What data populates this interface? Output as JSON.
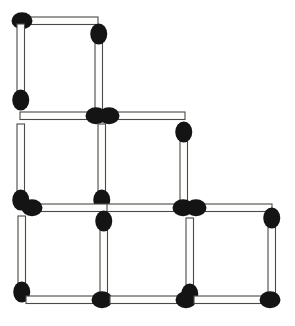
{
  "scene": {
    "title": "Matchstick puzzle figure",
    "description": "Line drawing of wooden matchsticks arranged to form a grid of squares",
    "width": 295,
    "height": 326,
    "background_color": "#ffffff",
    "stick_fill_color": "#fdfdfb",
    "stick_outline_color": "#4a4a4a",
    "head_color": "#141414",
    "match_count": 20,
    "stick_width": 7.5,
    "stick_length": 78,
    "head_rx": 8.5,
    "head_ry": 10.5
  },
  "matches": [
    {
      "id": "match-top-horizontal",
      "name": "top-row-horizontal-1",
      "orientation": "horizontal",
      "x": 20,
      "y": 17,
      "head_end": "start"
    },
    {
      "id": "match-upper-left-vertical",
      "name": "upper-left-vertical",
      "orientation": "vertical",
      "x": 17,
      "y": 24,
      "head_end": "end"
    },
    {
      "id": "match-upper-right-vertical",
      "name": "upper-right-vertical",
      "orientation": "vertical",
      "x": 95,
      "y": 32,
      "head_end": "start"
    },
    {
      "id": "match-row2-horizontal-left",
      "name": "row2-horizontal-left",
      "orientation": "horizontal",
      "x": 20,
      "y": 112,
      "head_end": "end"
    },
    {
      "id": "match-row2-horizontal-right",
      "name": "row2-horizontal-right",
      "orientation": "horizontal",
      "x": 107,
      "y": 112,
      "head_end": "start"
    },
    {
      "id": "match-row2-vertical-left",
      "name": "row2-vertical-left",
      "orientation": "vertical",
      "x": 17,
      "y": 124,
      "head_end": "end"
    },
    {
      "id": "match-row2-vertical-middle",
      "name": "row2-vertical-middle",
      "orientation": "vertical",
      "x": 98,
      "y": 124,
      "head_end": "end"
    },
    {
      "id": "match-row2-vertical-right",
      "name": "row2-vertical-right",
      "orientation": "vertical",
      "x": 180,
      "y": 130,
      "head_end": "start"
    },
    {
      "id": "match-row3-horizontal-left",
      "name": "row3-horizontal-left",
      "orientation": "horizontal",
      "x": 30,
      "y": 204,
      "head_end": "start"
    },
    {
      "id": "match-row3-horizontal-middle",
      "name": "row3-horizontal-middle",
      "orientation": "horizontal",
      "x": 107,
      "y": 204,
      "head_end": "end"
    },
    {
      "id": "match-row3-horizontal-right",
      "name": "row3-horizontal-right",
      "orientation": "horizontal",
      "x": 194,
      "y": 204,
      "head_end": "start"
    },
    {
      "id": "match-row4-vertical-left",
      "name": "row4-vertical-left",
      "orientation": "vertical",
      "x": 18,
      "y": 216,
      "head_end": "end"
    },
    {
      "id": "match-row4-vertical-middle",
      "name": "row4-vertical-middle",
      "orientation": "vertical",
      "x": 100,
      "y": 219,
      "head_end": "start"
    },
    {
      "id": "match-row4-vertical-midright",
      "name": "row4-vertical-midright",
      "orientation": "vertical",
      "x": 186,
      "y": 218,
      "head_end": "end"
    },
    {
      "id": "match-row4-vertical-right",
      "name": "row4-vertical-right",
      "orientation": "vertical",
      "x": 268,
      "y": 216,
      "head_end": "start"
    },
    {
      "id": "match-bottom-horizontal-left",
      "name": "bottom-horizontal-left",
      "orientation": "horizontal",
      "x": 26,
      "y": 296,
      "head_end": "end"
    },
    {
      "id": "match-bottom-horizontal-mid",
      "name": "bottom-horizontal-middle",
      "orientation": "horizontal",
      "x": 110,
      "y": 296,
      "head_end": "end"
    },
    {
      "id": "match-bottom-horizontal-right",
      "name": "bottom-horizontal-right",
      "orientation": "horizontal",
      "x": 194,
      "y": 296,
      "head_end": "end"
    }
  ]
}
